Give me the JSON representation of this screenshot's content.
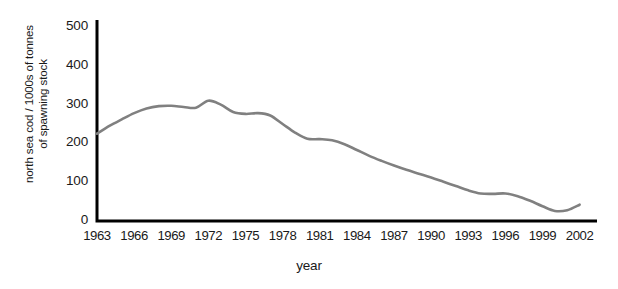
{
  "chart_data": {
    "type": "line",
    "title": "",
    "xlabel": "year",
    "ylabel_lines": [
      "north sea cod / 1000s of tonnes",
      "of spawning stock"
    ],
    "ylabel": "north sea cod / 1000s of tonnes of spawning stock",
    "xlim": [
      1963,
      2003
    ],
    "ylim": [
      0,
      530
    ],
    "yticks": [
      500,
      400,
      300,
      200,
      100,
      0
    ],
    "xticks": [
      1963,
      1966,
      1969,
      1972,
      1975,
      1978,
      1981,
      1984,
      1987,
      1990,
      1993,
      1996,
      1999,
      2002
    ],
    "grid": false,
    "legend": false,
    "line_color": "#808080",
    "axis_color": "#000000",
    "series": [
      {
        "name": "north sea cod spawning stock",
        "x": [
          1963,
          1964,
          1965,
          1966,
          1967,
          1968,
          1969,
          1970,
          1971,
          1972,
          1973,
          1974,
          1975,
          1976,
          1977,
          1978,
          1979,
          1980,
          1981,
          1982,
          1983,
          1984,
          1985,
          1986,
          1987,
          1988,
          1989,
          1990,
          1991,
          1992,
          1993,
          1994,
          1995,
          1996,
          1997,
          1998,
          1999,
          2000,
          2001,
          2002
        ],
        "values": [
          225,
          245,
          262,
          278,
          290,
          296,
          297,
          294,
          292,
          310,
          300,
          281,
          276,
          278,
          272,
          250,
          228,
          212,
          211,
          208,
          198,
          183,
          168,
          155,
          143,
          132,
          122,
          112,
          101,
          90,
          79,
          71,
          70,
          71,
          64,
          52,
          38,
          26,
          28,
          42
        ]
      }
    ]
  }
}
